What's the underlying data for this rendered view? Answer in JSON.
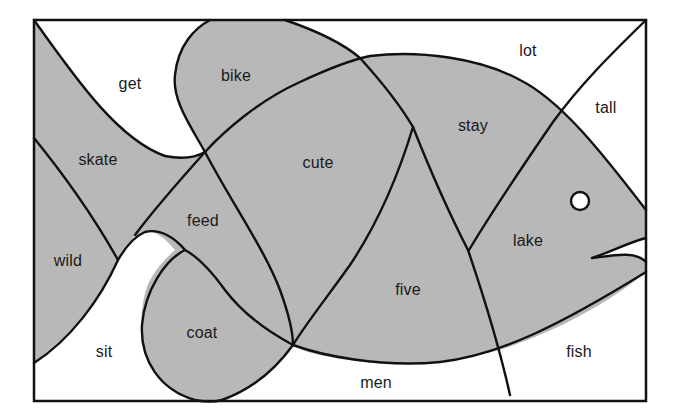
{
  "colors": {
    "background": "#ffffff",
    "shaded_region": "#b8b8b8",
    "line": "#111111",
    "text": "#1a1a1a"
  },
  "diagram": {
    "regions": [
      {
        "word": "get",
        "shaded": false,
        "x": 130,
        "y": 84
      },
      {
        "word": "bike",
        "shaded": true,
        "x": 236,
        "y": 76
      },
      {
        "word": "lot",
        "shaded": false,
        "x": 528,
        "y": 51
      },
      {
        "word": "tall",
        "shaded": false,
        "x": 606,
        "y": 108
      },
      {
        "word": "skate",
        "shaded": true,
        "x": 98,
        "y": 160
      },
      {
        "word": "cute",
        "shaded": true,
        "x": 318,
        "y": 163
      },
      {
        "word": "stay",
        "shaded": true,
        "x": 473,
        "y": 126
      },
      {
        "word": "feed",
        "shaded": true,
        "x": 203,
        "y": 221
      },
      {
        "word": "lake",
        "shaded": true,
        "x": 528,
        "y": 241
      },
      {
        "word": "wild",
        "shaded": true,
        "x": 68,
        "y": 261
      },
      {
        "word": "five",
        "shaded": true,
        "x": 408,
        "y": 290
      },
      {
        "word": "coat",
        "shaded": true,
        "x": 202,
        "y": 333
      },
      {
        "word": "sit",
        "shaded": false,
        "x": 104,
        "y": 352
      },
      {
        "word": "fish",
        "shaded": false,
        "x": 579,
        "y": 352
      },
      {
        "word": "men",
        "shaded": false,
        "x": 376,
        "y": 383
      }
    ],
    "eye": {
      "cx": 580,
      "cy": 201,
      "r": 9
    }
  }
}
